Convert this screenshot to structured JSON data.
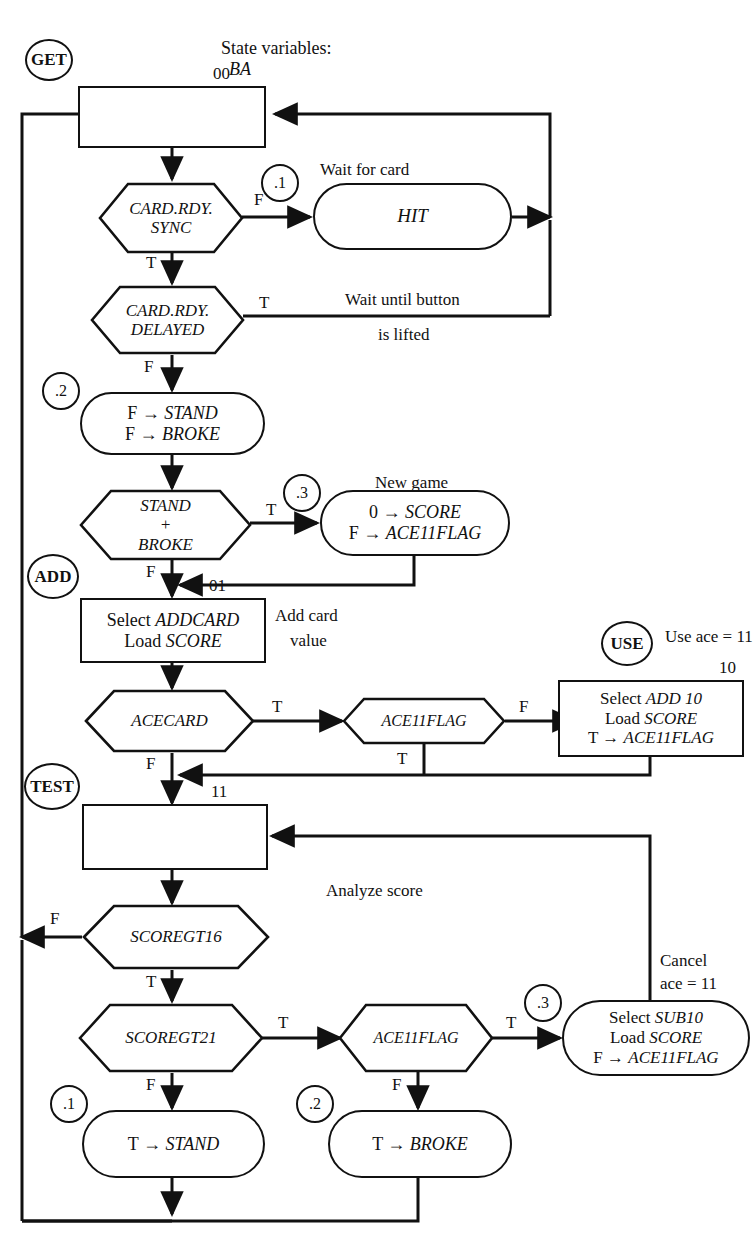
{
  "diagram": {
    "title": "State variables:",
    "title_var": "BA",
    "type": "asm-state-flowchart"
  },
  "state_names": [
    {
      "id": "get",
      "label": "GET"
    },
    {
      "id": "add",
      "label": "ADD"
    },
    {
      "id": "test",
      "label": "TEST"
    },
    {
      "id": "use",
      "label": "USE"
    }
  ],
  "sub_labels": [
    {
      "id": "s1a",
      "label": ".1"
    },
    {
      "id": "s2a",
      "label": ".2"
    },
    {
      "id": "s3a",
      "label": ".3"
    },
    {
      "id": "s3b",
      "label": ".3"
    },
    {
      "id": "s1b",
      "label": ".1"
    },
    {
      "id": "s2b",
      "label": ".2"
    }
  ],
  "state_codes": [
    {
      "id": "code00",
      "label": "00"
    },
    {
      "id": "code01",
      "label": "01"
    },
    {
      "id": "code10",
      "label": "10"
    },
    {
      "id": "code11",
      "label": "11"
    }
  ],
  "boxes": {
    "get_box": {
      "lines": []
    },
    "add_box": {
      "lines": [
        "Select ADDCARD",
        "Load SCORE"
      ],
      "plain": [
        "Select ",
        "Load "
      ],
      "em": [
        "ADDCARD",
        "SCORE"
      ]
    },
    "use_box": {
      "lines": [
        "Select ADD 10",
        "Load SCORE",
        "T → ACE11FLAG"
      ]
    },
    "test_box": {
      "lines": []
    }
  },
  "ovals": {
    "hit": {
      "text": "HIT"
    },
    "clear_flags": {
      "line1": "F → STAND",
      "line2": "F → BROKE"
    },
    "new_game": {
      "line1": "0 → SCORE",
      "line2": "F → ACE11FLAG"
    },
    "sub10": {
      "line1": "Select SUB10",
      "line2": "Load SCORE",
      "line3": "F → ACE11FLAG"
    },
    "set_stand": {
      "text": "T → STAND"
    },
    "set_broke": {
      "text": "T → BROKE"
    }
  },
  "decisions": {
    "card_rdy_sync": {
      "line1": "CARD.RDY.",
      "line2": "SYNC"
    },
    "card_rdy_delayed": {
      "line1": "CARD.RDY.",
      "line2": "DELAYED"
    },
    "stand_broke": {
      "line1": "STAND",
      "line2": "+",
      "line3": "BROKE"
    },
    "acecard": {
      "text": "ACECARD"
    },
    "ace11flag_add": {
      "text": "ACE11FLAG"
    },
    "scoregt16": {
      "text": "SCOREGT16"
    },
    "scoregt21": {
      "text": "SCOREGT21"
    },
    "ace11flag_test": {
      "text": "ACE11FLAG"
    }
  },
  "branch_labels": [
    {
      "id": "b-sync-f",
      "label": "F"
    },
    {
      "id": "b-sync-t",
      "label": "T"
    },
    {
      "id": "b-del-t",
      "label": "T"
    },
    {
      "id": "b-del-f",
      "label": "F"
    },
    {
      "id": "b-sb-t",
      "label": "T"
    },
    {
      "id": "b-sb-f",
      "label": "F"
    },
    {
      "id": "b-ace-t",
      "label": "T"
    },
    {
      "id": "b-ace-f",
      "label": "F"
    },
    {
      "id": "b-a11-f",
      "label": "F"
    },
    {
      "id": "b-a11-t",
      "label": "T"
    },
    {
      "id": "b-g16-f",
      "label": "F"
    },
    {
      "id": "b-g16-t",
      "label": "T"
    },
    {
      "id": "b-g21-t",
      "label": "T"
    },
    {
      "id": "b-g21-f",
      "label": "F"
    },
    {
      "id": "b-a11t-t",
      "label": "T"
    },
    {
      "id": "b-a11t-f",
      "label": "F"
    }
  ],
  "annotations": {
    "wait_for_card": "Wait for card",
    "wait_button_1": "Wait until button",
    "wait_button_2": "is lifted",
    "new_game": "New game",
    "add_card_1": "Add card",
    "add_card_2": "value",
    "use_ace": "Use ace = 11",
    "analyze_score": "Analyze score",
    "cancel_1": "Cancel",
    "cancel_2": "ace = 11"
  },
  "colors": {
    "ink": "#111111",
    "paper": "#ffffff"
  }
}
